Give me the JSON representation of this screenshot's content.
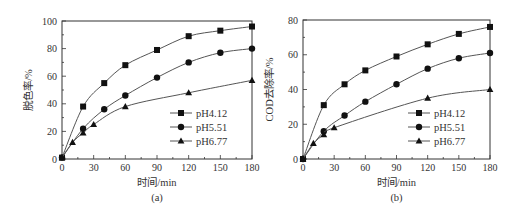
{
  "chart_data": [
    {
      "type": "line",
      "panel_label": "(a)",
      "title": "",
      "xlabel": "时间/min",
      "ylabel": "脱色率/%",
      "xlim": [
        0,
        180
      ],
      "ylim": [
        0,
        100
      ],
      "xticks": [
        0,
        30,
        60,
        90,
        120,
        150,
        180
      ],
      "yticks": [
        0,
        20,
        40,
        60,
        80,
        100
      ],
      "grid": false,
      "legend_position": "lower right",
      "series": [
        {
          "name": "pH4.12",
          "marker": "square",
          "x": [
            0,
            20,
            40,
            60,
            90,
            120,
            150,
            180
          ],
          "values": [
            1,
            38,
            55,
            68,
            79,
            89,
            93,
            96
          ]
        },
        {
          "name": "pH5.51",
          "marker": "circle",
          "x": [
            0,
            20,
            40,
            60,
            90,
            120,
            150,
            180
          ],
          "values": [
            1,
            22,
            36,
            46,
            59,
            70,
            77,
            80
          ]
        },
        {
          "name": "pH6.77",
          "marker": "triangle",
          "x": [
            0,
            10,
            20,
            30,
            60,
            120,
            180
          ],
          "values": [
            1,
            12,
            19,
            25,
            38,
            48,
            57
          ]
        }
      ]
    },
    {
      "type": "line",
      "panel_label": "(b)",
      "title": "",
      "xlabel": "时间/min",
      "ylabel": "COD去除率/%",
      "xlim": [
        0,
        180
      ],
      "ylim": [
        0,
        80
      ],
      "xticks": [
        0,
        30,
        60,
        90,
        120,
        150,
        180
      ],
      "yticks": [
        0,
        20,
        40,
        60,
        80
      ],
      "grid": false,
      "legend_position": "lower right",
      "series": [
        {
          "name": "pH4.12",
          "marker": "square",
          "x": [
            0,
            20,
            40,
            60,
            90,
            120,
            150,
            180
          ],
          "values": [
            0,
            31,
            43,
            51,
            59,
            66,
            72,
            76
          ]
        },
        {
          "name": "pH5.51",
          "marker": "circle",
          "x": [
            0,
            20,
            40,
            60,
            90,
            120,
            150,
            180
          ],
          "values": [
            0,
            16,
            25,
            33,
            43,
            52,
            58,
            61
          ]
        },
        {
          "name": "pH6.77",
          "marker": "triangle",
          "x": [
            0,
            10,
            20,
            30,
            120,
            180
          ],
          "values": [
            0,
            9,
            14,
            18,
            35,
            40
          ]
        }
      ]
    }
  ],
  "colors": {
    "line": "#555555",
    "marker": "#111111",
    "axis": "#333333"
  }
}
